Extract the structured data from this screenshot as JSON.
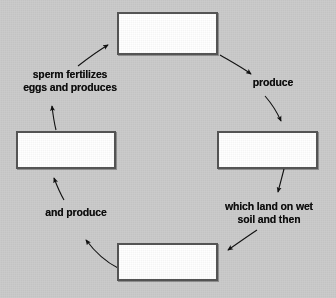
{
  "diagram": {
    "type": "cycle-diagram",
    "background_color": "#cbcbcb",
    "box_fill_color": "#ffffff",
    "box_border_color": "#555555",
    "text_color": "#0d0d0d",
    "boxes": [
      {
        "id": "box-top",
        "label": "",
        "position": "top",
        "state": "blank"
      },
      {
        "id": "box-right",
        "label": "",
        "position": "right",
        "state": "blank"
      },
      {
        "id": "box-bottom",
        "label": "",
        "position": "bottom",
        "state": "blank"
      },
      {
        "id": "box-left",
        "label": "",
        "position": "left",
        "state": "blank"
      }
    ],
    "labels": [
      {
        "id": "label-top-left",
        "text": "sperm fertilizes\neggs and produces",
        "position": "upper-left"
      },
      {
        "id": "label-top-right",
        "text": "produce",
        "position": "upper-right"
      },
      {
        "id": "label-bottom-right",
        "text": "which land on wet\nsoil and then",
        "position": "lower-right"
      },
      {
        "id": "label-bottom-left",
        "text": "and produce",
        "position": "lower-left"
      }
    ],
    "arrows": [
      {
        "id": "arrow-top-to-produce",
        "from": "box-top",
        "to": "label-top-right",
        "direction": "clockwise"
      },
      {
        "id": "arrow-produce-to-right",
        "from": "label-top-right",
        "to": "box-right",
        "direction": "clockwise"
      },
      {
        "id": "arrow-right-to-wetsoil",
        "from": "box-right",
        "to": "label-bottom-right",
        "direction": "clockwise"
      },
      {
        "id": "arrow-wetsoil-to-bottom",
        "from": "label-bottom-right",
        "to": "box-bottom",
        "direction": "clockwise"
      },
      {
        "id": "arrow-bottom-to-andproduce",
        "from": "box-bottom",
        "to": "label-bottom-left",
        "direction": "clockwise"
      },
      {
        "id": "arrow-andproduce-to-left",
        "from": "label-bottom-left",
        "to": "box-left",
        "direction": "clockwise"
      },
      {
        "id": "arrow-left-to-sperm",
        "from": "box-left",
        "to": "label-top-left",
        "direction": "clockwise"
      },
      {
        "id": "arrow-sperm-to-top",
        "from": "label-top-left",
        "to": "box-top",
        "direction": "clockwise"
      }
    ]
  }
}
